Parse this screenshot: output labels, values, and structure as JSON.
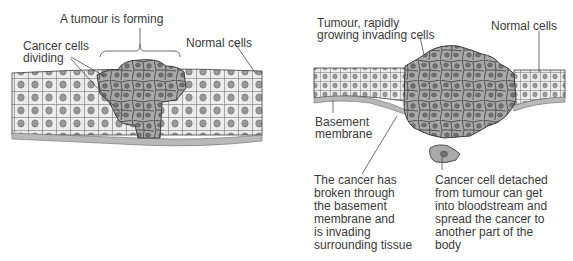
{
  "colors": {
    "normal_cell_fill": "#ececec",
    "normal_nucleus": "#9a9a9a",
    "cancer_cell_fill": "#a9a9a9",
    "cancer_nucleus": "#707070",
    "membrane": "#b9b9b9",
    "outline": "#3c3c3c"
  },
  "left_panel": {
    "labels": {
      "tumour_forming": "A tumour is forming",
      "cancer_dividing_line1": "Cancer cells",
      "cancer_dividing_line2": "dividing",
      "normal_cells": "Normal cells"
    }
  },
  "right_panel": {
    "labels": {
      "tumour_line1": "Tumour, rapidly",
      "tumour_line2": "growing invading cells",
      "normal_cells": "Normal cells",
      "basement_line1": "Basement",
      "basement_line2": "membrane",
      "broken_through": [
        "The cancer has",
        "broken through",
        "the basement",
        "membrane and",
        "is invading",
        "surrounding tissue"
      ],
      "detached": [
        "Cancer cell detached",
        "from tumour can get",
        "into bloodstream and",
        "spread the cancer to",
        "another part of the",
        "body"
      ]
    }
  }
}
